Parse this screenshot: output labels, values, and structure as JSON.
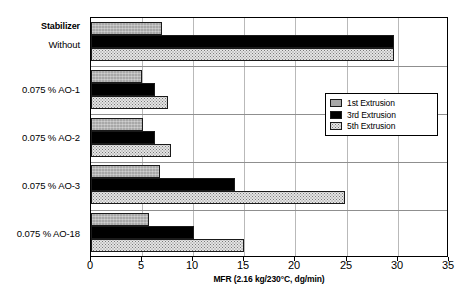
{
  "chart_data": {
    "type": "bar",
    "orientation": "horizontal",
    "title": "",
    "subtitle": "",
    "xlabel": "MFR (2.16 kg/230°C, dg/min)",
    "ylabel": "",
    "category_header": "Stabilizer",
    "categories": [
      "Without",
      "0.075 % AO-1",
      "0.075 % AO-2",
      "0.075 % AO-3",
      "0.075 % AO-18"
    ],
    "series": [
      {
        "name": "1st Extrusion",
        "color": "#a8a8a8",
        "values": [
          7.0,
          5.0,
          5.1,
          6.8,
          5.7
        ]
      },
      {
        "name": "3rd Extrusion",
        "color": "#000000",
        "values": [
          29.8,
          6.3,
          6.3,
          14.2,
          10.1
        ]
      },
      {
        "name": "5th Extrusion",
        "color": "#e4e4e4",
        "values": [
          29.8,
          7.6,
          7.9,
          25.0,
          15.0
        ]
      }
    ],
    "xlim": [
      0,
      35
    ],
    "xticks": [
      0,
      5,
      10,
      15,
      20,
      25,
      30,
      35
    ],
    "grid": true,
    "grid_axis": "x",
    "legend_position": "upper-right-inside",
    "legend_entries": [
      "1st Extrusion",
      "3rd Extrusion",
      "5th Extrusion"
    ]
  }
}
